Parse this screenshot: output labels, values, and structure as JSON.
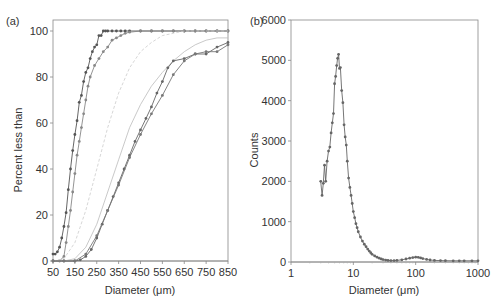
{
  "chart_data": [
    {
      "panel": "(a)",
      "type": "line",
      "title": "",
      "xlabel": "Diameter (μm)",
      "ylabel": "Percent less than",
      "xlim": [
        50,
        850
      ],
      "ylim": [
        0,
        100
      ],
      "xticks": [
        50,
        150,
        250,
        350,
        450,
        550,
        650,
        750,
        850
      ],
      "yticks": [
        0,
        20,
        40,
        60,
        80,
        100
      ],
      "grid": false,
      "legend": null,
      "series": [
        {
          "name": "series-1 (dark, markers)",
          "color": "#555555",
          "marker": true,
          "x": [
            50,
            60,
            70,
            80,
            90,
            100,
            110,
            120,
            130,
            140,
            150,
            160,
            170,
            180,
            190,
            200,
            210,
            220,
            230,
            240,
            250,
            260,
            270,
            280,
            290,
            300,
            320,
            340,
            360,
            380,
            400,
            450,
            500,
            550,
            600,
            650,
            700,
            750,
            800,
            850
          ],
          "y": [
            3,
            3,
            4,
            6,
            10,
            15,
            21,
            31,
            40,
            48,
            55,
            61,
            69,
            72,
            78,
            82,
            84,
            88,
            91,
            93,
            94,
            98,
            98,
            100,
            100,
            100,
            100,
            100,
            100,
            100,
            100,
            100,
            100,
            100,
            100,
            100,
            100,
            100,
            100,
            100
          ]
        },
        {
          "name": "series-2 (gray, markers)",
          "color": "#888888",
          "marker": true,
          "x": [
            50,
            80,
            100,
            110,
            120,
            130,
            140,
            150,
            160,
            170,
            180,
            190,
            200,
            210,
            220,
            240,
            260,
            280,
            300,
            320,
            340,
            360,
            380,
            400,
            450,
            500,
            550,
            600,
            650,
            700,
            750,
            800,
            850
          ],
          "y": [
            0,
            0,
            2,
            8,
            15,
            22,
            30,
            38,
            46,
            52,
            58,
            64,
            70,
            76,
            80,
            85,
            88,
            91,
            93,
            96,
            97,
            98,
            99,
            99.5,
            100,
            100,
            100,
            100,
            100,
            100,
            100,
            100,
            100
          ]
        },
        {
          "name": "series-3 (light dashed)",
          "color": "#cccccc",
          "marker": false,
          "x": [
            50,
            100,
            150,
            200,
            250,
            300,
            350,
            400,
            450,
            500,
            550,
            600,
            650,
            700,
            750,
            800,
            850
          ],
          "y": [
            0,
            1,
            8,
            22,
            40,
            58,
            73,
            84,
            91,
            95,
            98,
            99,
            100,
            100,
            100,
            100,
            100
          ]
        },
        {
          "name": "series-4 (light solid)",
          "color": "#bbbbbb",
          "marker": false,
          "x": [
            50,
            100,
            150,
            200,
            250,
            300,
            350,
            400,
            450,
            500,
            550,
            600,
            650,
            700,
            750,
            800,
            850
          ],
          "y": [
            0,
            0,
            1,
            6,
            16,
            30,
            44,
            58,
            68,
            76,
            82,
            87,
            91,
            94,
            96,
            97,
            97
          ]
        },
        {
          "name": "series-5 (dark, markers)",
          "color": "#666666",
          "marker": true,
          "x": [
            50,
            100,
            150,
            175,
            200,
            225,
            250,
            275,
            300,
            325,
            350,
            375,
            400,
            425,
            450,
            475,
            500,
            525,
            550,
            575,
            600,
            650,
            700,
            750,
            800,
            850
          ],
          "y": [
            0,
            0,
            0,
            0.5,
            2,
            5,
            10,
            16,
            22,
            28,
            34,
            40,
            46,
            52,
            57,
            62,
            67,
            73,
            78,
            84,
            87,
            88,
            90,
            90,
            93,
            95
          ]
        },
        {
          "name": "series-6 (gray, markers)",
          "color": "#777777",
          "marker": true,
          "x": [
            50,
            100,
            150,
            200,
            250,
            300,
            350,
            400,
            450,
            500,
            550,
            600,
            650,
            700,
            750,
            800,
            850
          ],
          "y": [
            0,
            0,
            0,
            3,
            11,
            22,
            33,
            45,
            55,
            64,
            72,
            81,
            87,
            90,
            91,
            91,
            94
          ]
        }
      ]
    },
    {
      "panel": "(b)",
      "type": "line",
      "title": "",
      "xlabel": "Diameter (μm)",
      "ylabel": "Counts",
      "xscale": "log",
      "xlim": [
        1,
        1000
      ],
      "ylim": [
        0,
        6000
      ],
      "xticks": [
        1,
        10,
        100,
        1000
      ],
      "yticks": [
        0,
        1000,
        2000,
        3000,
        4000,
        5000,
        6000
      ],
      "grid": false,
      "legend": null,
      "series": [
        {
          "name": "counts",
          "color": "#666666",
          "marker": true,
          "x": [
            3.0,
            3.15,
            3.3,
            3.45,
            3.6,
            3.8,
            4.0,
            4.2,
            4.4,
            4.6,
            4.8,
            5.0,
            5.2,
            5.4,
            5.6,
            5.8,
            6.0,
            6.2,
            6.5,
            6.8,
            7.1,
            7.4,
            7.7,
            8.0,
            8.4,
            8.8,
            9.2,
            9.6,
            10,
            10.5,
            11,
            11.5,
            12,
            13,
            14,
            15,
            16,
            17,
            18,
            19,
            20,
            22,
            24,
            26,
            28,
            30,
            33,
            36,
            40,
            45,
            50,
            60,
            70,
            80,
            90,
            100,
            110,
            120,
            130,
            150,
            170,
            200,
            250,
            300,
            400,
            500,
            600,
            800,
            1000
          ],
          "y": [
            2000,
            1650,
            1950,
            2400,
            2000,
            2500,
            2750,
            2850,
            3200,
            3450,
            3680,
            4420,
            4600,
            4870,
            5050,
            5150,
            4800,
            4820,
            4250,
            3950,
            3400,
            3100,
            2900,
            2500,
            2080,
            1850,
            1650,
            1450,
            1250,
            1100,
            950,
            850,
            750,
            620,
            520,
            440,
            380,
            320,
            270,
            230,
            190,
            150,
            120,
            95,
            75,
            60,
            48,
            40,
            35,
            35,
            40,
            55,
            75,
            95,
            110,
            120,
            115,
            100,
            85,
            65,
            50,
            40,
            35,
            32,
            30,
            30,
            30,
            30,
            30
          ]
        }
      ]
    }
  ],
  "panels": {
    "a": {
      "label": "(a)",
      "xlabel": "Diameter (μm)",
      "ylabel": "Percent less than",
      "xtick_labels": [
        "50",
        "150",
        "250",
        "350",
        "450",
        "550",
        "650",
        "750",
        "850"
      ],
      "ytick_labels": [
        "0",
        "20",
        "40",
        "60",
        "80",
        "100"
      ]
    },
    "b": {
      "label": "(b)",
      "xlabel": "Diameter (μm)",
      "ylabel": "Counts",
      "xtick_labels": [
        "1",
        "10",
        "100",
        "1000"
      ],
      "ytick_labels": [
        "0",
        "1000",
        "2000",
        "3000",
        "4000",
        "5000",
        "6000"
      ]
    }
  }
}
